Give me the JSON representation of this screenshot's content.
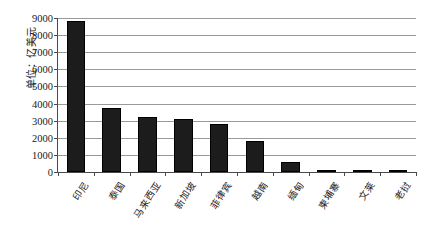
{
  "chart_data": {
    "type": "bar",
    "title": "",
    "subtitle": "",
    "xlabel": "",
    "ylabel": "单位：亿美元",
    "ylim": [
      0,
      9000
    ],
    "ytick_step": 1000,
    "yticks": [
      "0",
      "1000",
      "2000",
      "3000",
      "4000",
      "5000",
      "6000",
      "7000",
      "8000",
      "9000"
    ],
    "grid": true,
    "legend": "none",
    "bar_color": "#1c1c1c",
    "axis_color": "#4a4a4a",
    "gridline_color": "#9a9a9a",
    "categories": [
      "印尼",
      "泰国",
      "马来西亚",
      "新加坡",
      "菲律宾",
      "越南",
      "缅甸",
      "柬埔寨",
      "文莱",
      "老挝"
    ],
    "values": [
      8850,
      3750,
      3230,
      3080,
      2800,
      1800,
      600,
      140,
      120,
      100
    ],
    "series": [
      {
        "name": "",
        "values": [
          8850,
          3750,
          3230,
          3080,
          2800,
          1800,
          600,
          140,
          120,
          100
        ]
      }
    ]
  }
}
